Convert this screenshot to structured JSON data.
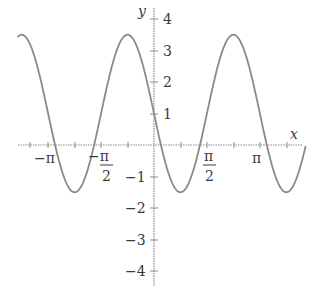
{
  "chart_data": {
    "type": "line",
    "title": "",
    "xlabel": "x",
    "ylabel": "y",
    "function": "y = 1 - 2.5 sin(2x)",
    "xlim": [
      -4.05,
      4.4
    ],
    "ylim": [
      -4.3,
      4.1
    ],
    "grid": false,
    "x_ticks": [
      {
        "value": -3.14159,
        "label": "−π"
      },
      {
        "value": -1.5708,
        "label": "−π/2"
      },
      {
        "value": 1.5708,
        "label": "π/2"
      },
      {
        "value": 3.14159,
        "label": "π"
      }
    ],
    "y_ticks": [
      {
        "value": 4,
        "label": "4"
      },
      {
        "value": 3,
        "label": "3"
      },
      {
        "value": 2,
        "label": "2"
      },
      {
        "value": 1,
        "label": "1"
      },
      {
        "value": -1,
        "label": "−1"
      },
      {
        "value": -2,
        "label": "−2"
      },
      {
        "value": -3,
        "label": "−3"
      },
      {
        "value": -4,
        "label": "−4"
      }
    ],
    "series": [
      {
        "name": "curve",
        "x_range": [
          -4.0,
          4.5
        ],
        "amplitude": 2.5,
        "midline": 1,
        "period": 3.14159,
        "max": 3.5,
        "min": -1.5,
        "y_at_0": 1
      }
    ],
    "colors": {
      "curve": "#8a8a8a",
      "axes": "#8c8c8c",
      "labels": "#3a3a3a"
    }
  },
  "labels": {
    "x_axis": "x",
    "y_axis": "y",
    "neg_pi": "−π",
    "neg_pi_half_num": "−π",
    "neg_pi_half_den": "2",
    "pi_half_num": "π",
    "pi_half_den": "2",
    "pi": "π",
    "y4": "4",
    "y3": "3",
    "y2": "2",
    "y1": "1",
    "yn1": "−1",
    "yn2": "−2",
    "yn3": "−3",
    "yn4": "−4"
  }
}
